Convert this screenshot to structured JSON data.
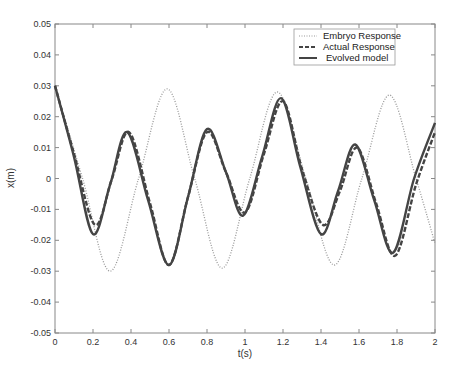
{
  "chart_data": {
    "type": "line",
    "title": "",
    "xlabel": "t(s)",
    "ylabel": "x(m)",
    "xlim": [
      0,
      2
    ],
    "ylim": [
      -0.05,
      0.05
    ],
    "grid": false,
    "legend_position": "upper right",
    "xticks": [
      "0",
      "0.2",
      "0.4",
      "0.6",
      "0.8",
      "1",
      "1.2",
      "1.4",
      "1.6",
      "1.8",
      "2"
    ],
    "yticks": [
      "0.05",
      "0.04",
      "0.03",
      "0.02",
      "0.01",
      "0",
      "-0.01",
      "-0.02",
      "-0.03",
      "-0.04",
      "-0.05"
    ],
    "series": [
      {
        "name": "Embryo Response",
        "style": "dotted",
        "color": "#888888",
        "x": [
          0,
          0.145,
          0.29,
          0.44,
          0.59,
          0.735,
          0.88,
          1.025,
          1.17,
          1.32,
          1.47,
          1.615,
          1.76,
          1.9,
          2.0
        ],
        "y": [
          0.03,
          0.0,
          -0.03,
          0.0,
          0.029,
          0.0,
          -0.029,
          0.0,
          0.028,
          0.0,
          -0.028,
          0.0,
          0.027,
          0.0,
          -0.021
        ]
      },
      {
        "name": "Actual Response",
        "style": "dashed",
        "color": "#333333",
        "x": [
          0,
          0.1,
          0.21,
          0.3,
          0.39,
          0.5,
          0.6,
          0.7,
          0.8,
          0.9,
          1.0,
          1.1,
          1.2,
          1.3,
          1.41,
          1.5,
          1.59,
          1.69,
          1.79,
          1.9,
          2.0
        ],
        "y": [
          0.03,
          0.008,
          -0.015,
          0.0,
          0.015,
          -0.008,
          -0.028,
          -0.006,
          0.015,
          0.002,
          -0.011,
          0.008,
          0.025,
          0.003,
          -0.015,
          -0.004,
          0.01,
          -0.008,
          -0.025,
          -0.002,
          0.015
        ]
      },
      {
        "name": "Evolved model",
        "style": "solid",
        "color": "#333333",
        "x": [
          0,
          0.1,
          0.2,
          0.29,
          0.38,
          0.49,
          0.6,
          0.7,
          0.8,
          0.9,
          0.99,
          1.09,
          1.19,
          1.29,
          1.4,
          1.49,
          1.58,
          1.68,
          1.78,
          1.89,
          2.0
        ],
        "y": [
          0.03,
          0.007,
          -0.018,
          -0.002,
          0.015,
          -0.007,
          -0.028,
          -0.006,
          0.016,
          0.002,
          -0.012,
          0.007,
          0.026,
          0.004,
          -0.018,
          -0.004,
          0.011,
          -0.007,
          -0.024,
          0.0,
          0.018
        ]
      }
    ]
  }
}
